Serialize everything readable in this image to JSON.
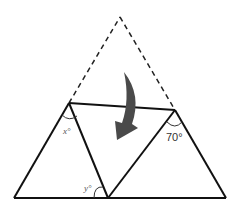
{
  "diagram": {
    "colors": {
      "line": "#111111",
      "dashed": "#222222",
      "arrow": "#4a4a4a",
      "background": "#ffffff"
    },
    "points": {
      "apex": [
        120,
        17
      ],
      "fold_left": [
        69,
        103
      ],
      "fold_right": [
        175,
        110
      ],
      "base_left": [
        14,
        198
      ],
      "base_mid": [
        108,
        198
      ],
      "base_right": [
        226,
        198
      ]
    },
    "labels": {
      "angle_x": "x°",
      "angle_y": "y°",
      "angle_70": "70°"
    },
    "arrow": {
      "icon": "curved-fold-arrow-icon",
      "description": "Curved arrow pointing down indicating fold"
    }
  }
}
